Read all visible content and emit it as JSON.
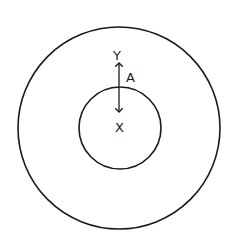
{
  "diagram": {
    "outer_circle": {
      "cx": 119,
      "cy": 128,
      "r": 101
    },
    "inner_circle": {
      "cx": 120,
      "cy": 128,
      "r": 41
    },
    "arrow": {
      "x": 119,
      "y_top": 63,
      "y_bottom": 112,
      "double_headed": true
    },
    "labels": {
      "y": {
        "text": "Y",
        "x": 117,
        "y": 60
      },
      "x": {
        "text": "X",
        "x": 121,
        "y": 131
      },
      "a": {
        "text": "A",
        "x": 131,
        "y": 81
      }
    },
    "stroke_color": "#1a1a1a"
  }
}
